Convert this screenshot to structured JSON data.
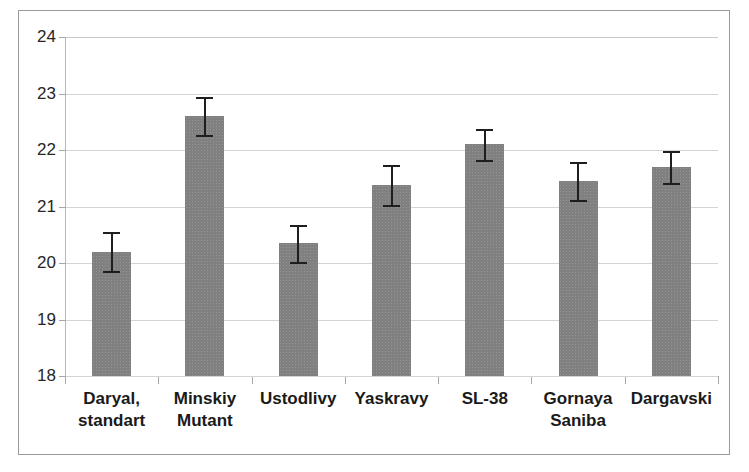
{
  "chart_data": {
    "type": "bar",
    "title": "",
    "subtitle": "",
    "xlabel": "",
    "ylabel": "",
    "ylim": [
      18,
      24
    ],
    "ytick_labels": [
      "24",
      "23",
      "22",
      "21",
      "20",
      "19",
      "18"
    ],
    "ytick_values": [
      24,
      23,
      22,
      21,
      20,
      19,
      18
    ],
    "grid": true,
    "legend": null,
    "bar_color": "#808080",
    "errorbar_color": "#1e1e1e",
    "categories": [
      "Daryal, standart",
      "Minskiy Mutant",
      "Ustodlivy",
      "Yaskravy",
      "SL-38",
      "Gornaya Saniba",
      "Dargavski"
    ],
    "category_lines": [
      [
        "Daryal,",
        "standart"
      ],
      [
        "Minskiy",
        "Mutant"
      ],
      [
        "Ustodlivy",
        ""
      ],
      [
        "Yaskravy",
        ""
      ],
      [
        "SL-38",
        ""
      ],
      [
        "Gornaya",
        "Saniba"
      ],
      [
        "Dargavski",
        ""
      ]
    ],
    "values": [
      20.2,
      22.6,
      20.35,
      21.38,
      22.1,
      21.45,
      21.7
    ],
    "errors": [
      0.35,
      0.33,
      0.33,
      0.35,
      0.28,
      0.33,
      0.28
    ],
    "error_low": [
      19.85,
      22.27,
      20.02,
      21.03,
      21.82,
      21.12,
      21.42
    ],
    "error_high": [
      20.55,
      22.93,
      20.68,
      21.73,
      22.38,
      21.78,
      21.98
    ]
  }
}
